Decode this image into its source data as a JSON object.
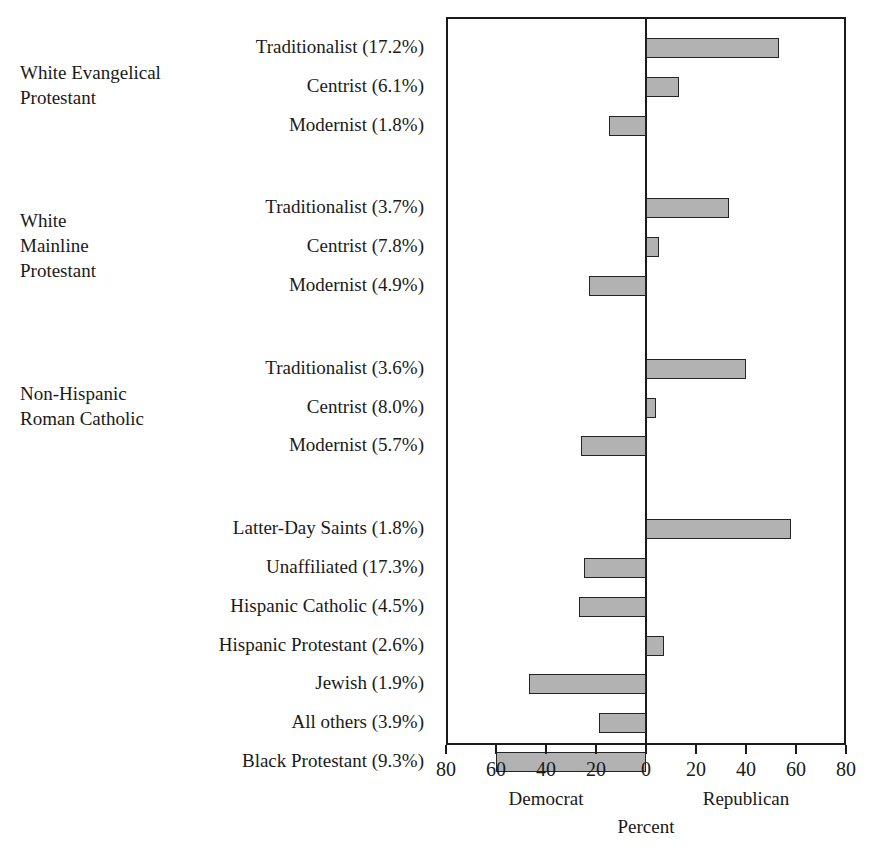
{
  "chart_data": {
    "type": "bar",
    "title": "",
    "subtitle": "",
    "xlabel": "Percent",
    "ylabel": "",
    "xlim": [
      -80,
      80
    ],
    "grid": false,
    "legend": null,
    "orientation": "horizontal",
    "axis": {
      "tick_labels": [
        "80",
        "60",
        "40",
        "20",
        "0",
        "20",
        "40",
        "60",
        "80"
      ],
      "tick_values": [
        -80,
        -60,
        -40,
        -20,
        0,
        20,
        40,
        60,
        80
      ],
      "left_direction_label": "Democrat",
      "right_direction_label": "Republican",
      "title": "Percent"
    },
    "note": "Positive values extend right (Republican); negative values extend left (Democrat).",
    "groups": [
      {
        "label": "White Evangelical\nProtestant",
        "rows": [
          {
            "category": "Traditionalist",
            "share": "17.2%",
            "label": "Traditionalist (17.2%)",
            "value": 53
          },
          {
            "category": "Centrist",
            "share": "6.1%",
            "label": "Centrist (6.1%)",
            "value": 13
          },
          {
            "category": "Modernist",
            "share": "1.8%",
            "label": "Modernist (1.8%)",
            "value": -15
          }
        ]
      },
      {
        "label": "White\nMainline\nProtestant",
        "rows": [
          {
            "category": "Traditionalist",
            "share": "3.7%",
            "label": "Traditionalist (3.7%)",
            "value": 33
          },
          {
            "category": "Centrist",
            "share": "7.8%",
            "label": "Centrist (7.8%)",
            "value": 5
          },
          {
            "category": "Modernist",
            "share": "4.9%",
            "label": "Modernist (4.9%)",
            "value": -23
          }
        ]
      },
      {
        "label": "Non-Hispanic\nRoman Catholic",
        "rows": [
          {
            "category": "Traditionalist",
            "share": "3.6%",
            "label": "Traditionalist (3.6%)",
            "value": 40
          },
          {
            "category": "Centrist",
            "share": "8.0%",
            "label": "Centrist (8.0%)",
            "value": 4
          },
          {
            "category": "Modernist",
            "share": "5.7%",
            "label": "Modernist (5.7%)",
            "value": -26
          }
        ]
      },
      {
        "label": "",
        "rows": [
          {
            "category": "Latter-Day Saints",
            "share": "1.8%",
            "label": "Latter-Day Saints (1.8%)",
            "value": 58
          },
          {
            "category": "Unaffiliated",
            "share": "17.3%",
            "label": "Unaffiliated (17.3%)",
            "value": -25
          },
          {
            "category": "Hispanic Catholic",
            "share": "4.5%",
            "label": "Hispanic Catholic (4.5%)",
            "value": -27
          },
          {
            "category": "Hispanic Protestant",
            "share": "2.6%",
            "label": "Hispanic Protestant (2.6%)",
            "value": 7
          },
          {
            "category": "Jewish",
            "share": "1.9%",
            "label": "Jewish (1.9%)",
            "value": -47
          },
          {
            "category": "All others",
            "share": "3.9%",
            "label": "All others (3.9%)",
            "value": -19
          },
          {
            "category": "Black Protestant",
            "share": "9.3%",
            "label": "Black Protestant (9.3%)",
            "value": -60
          }
        ]
      }
    ],
    "colors": {
      "bar_fill": "#b2b2b2",
      "bar_border": "#242424",
      "axis": "#1a1a1a",
      "background": "#ffffff"
    }
  }
}
